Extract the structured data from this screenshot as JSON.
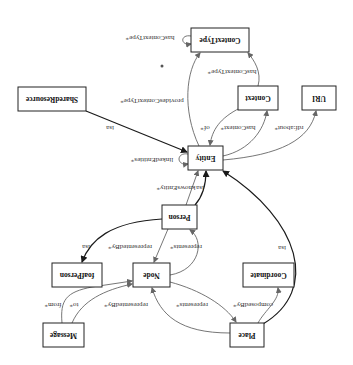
{
  "diagram": {
    "orientation": "rotated-180",
    "nodes": {
      "context_type": "ContextType",
      "context": "Context",
      "uri": "URI",
      "shared_resource": "SharedResource",
      "entity": "Entity",
      "person": "Person",
      "foaf_person": "foafPerson",
      "node": "Node",
      "coordinate": "Coordinate",
      "message": "Message",
      "place": "Place"
    },
    "edges": {
      "has_context_type_self": "hasContextType*",
      "has_context_type": "hasContextType*",
      "provides_context_type": "providesContextType*",
      "of": "of*",
      "has_context": "hasContext*",
      "rdf_about": "rdf:about*",
      "linked_entities": "linkedEntities*",
      "shared_isa": "isa",
      "knows_entity": "knowsEntity*",
      "person_isa": "isa",
      "foaf_isa": "isa",
      "person_represented_by": "representedBy*",
      "node_represents_person": "represents*",
      "node_represents_place": "represents*",
      "place_represented_by": "representedBy*",
      "composed_by": "composedBy*",
      "place_isa": "isa",
      "to": "to*",
      "from": "from*"
    },
    "colors": {
      "isa_edge": "#1a1a1a",
      "relation_edge": "#666666",
      "node_border": "#222222"
    }
  }
}
